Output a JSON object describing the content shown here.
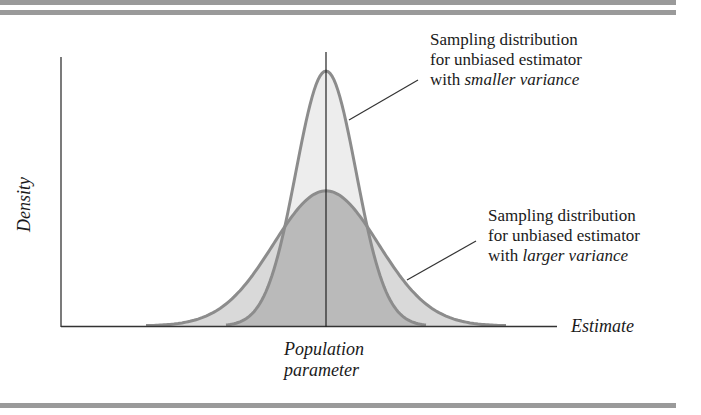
{
  "chart_data": {
    "type": "area",
    "title": "",
    "xlabel": "Estimate",
    "ylabel": "Density",
    "x_tick_labels": [
      "Population parameter"
    ],
    "grid": false,
    "legend": null,
    "series": [
      {
        "name": "Sampling distribution for unbiased estimator with smaller variance",
        "center": 0,
        "relative_sd": 1.0,
        "relative_peak_height": 1.0
      },
      {
        "name": "Sampling distribution for unbiased estimator with larger variance",
        "center": 0,
        "relative_sd": 1.75,
        "relative_peak_height": 0.53
      }
    ],
    "annotations": [
      {
        "text": "Sampling distribution for unbiased estimator with smaller variance",
        "points_to": "narrow curve"
      },
      {
        "text": "Sampling distribution for unbiased estimator with larger variance",
        "points_to": "wide curve"
      }
    ]
  },
  "labels": {
    "y_axis": "Density",
    "x_axis": "Estimate",
    "center_line_line1": "Population",
    "center_line_line2": "parameter",
    "small_var": {
      "line1": "Sampling distribution",
      "line2": "for unbiased estimator",
      "line3_prefix": "with ",
      "line3_italic": "smaller variance"
    },
    "large_var": {
      "line1": "Sampling distribution",
      "line2": "for unbiased estimator",
      "line3_prefix": "with ",
      "line3_italic": "larger variance"
    }
  },
  "colors": {
    "band": "#9a9a9a",
    "curve_stroke": "#8c8c8c",
    "narrow_fill": "#ececec",
    "wide_fill": "#d9d9d9",
    "overlap_fill": "#b9b9b9",
    "axis": "#333333"
  }
}
